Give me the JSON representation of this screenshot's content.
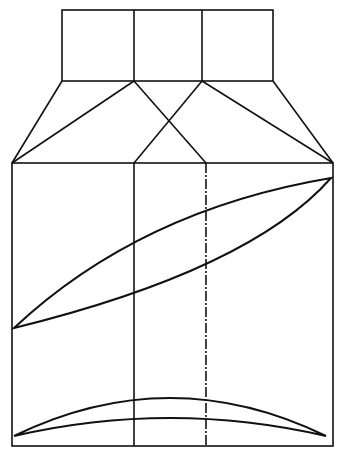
{
  "diagram": {
    "type": "geologic facies schematic",
    "top_panel": {
      "cells": [
        {
          "label": "B",
          "pattern": "solid-hatch"
        },
        {
          "label": "A",
          "pattern": "dots"
        },
        {
          "label": "G",
          "pattern": "dashed-hatch"
        }
      ]
    },
    "bottom_panel": {
      "zones": [
        "B",
        "A",
        "G"
      ],
      "lenses": [
        {
          "name": "upper-lens",
          "pattern": "dots"
        },
        {
          "name": "lower-lens",
          "pattern": "dots"
        }
      ]
    },
    "colors": {
      "ink": "#111111",
      "paper": "#ffffff"
    }
  }
}
